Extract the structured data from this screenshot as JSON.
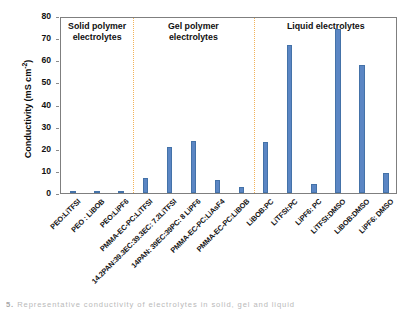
{
  "chart_data": {
    "type": "bar",
    "title": "",
    "xlabel": "",
    "ylabel": "Conductivity (mS cm-2)",
    "ylabel_main": "Conductivity (mS cm",
    "ylabel_exp": "-2",
    "ylabel_close": ")",
    "ylim": [
      0,
      80
    ],
    "yticks": [
      0,
      10,
      20,
      30,
      40,
      50,
      60,
      70,
      80
    ],
    "grid": false,
    "legend": "none",
    "bar_color": "#5b86c4",
    "divider_color": "#f2b35a",
    "axis_color": "#7f7f7f",
    "categories": [
      "PEO:LiTFSI",
      "PEO : LiBOB",
      "PEO:LiPF6",
      "PMMA-EC-PC:LiTFSI",
      "14.2PAN:39.3EC:39.3EC: 7.2LiTFSI",
      "14PAN: 39EC:39PC: 8 LiPF6",
      "PMMA-EC-PC:LiAsF4",
      "PMMA-EC-PC:LiBOB",
      "LiBOB:PC",
      "LiTFSI:PC",
      "LiPF6: PC",
      "LiTFSI:DMSO",
      "LiBOB:DMSO",
      "LiPF6: DMSO"
    ],
    "values": [
      1.0,
      0.8,
      0.3,
      7.0,
      21.0,
      23.5,
      6.0,
      2.5,
      23.0,
      67.0,
      4.0,
      74.0,
      58.0,
      9.0
    ],
    "regions": [
      {
        "label_line1": "Solid polymer",
        "label_line2": "electrolytes",
        "start_index": 0,
        "end_index": 2
      },
      {
        "label_line1": "Gel polymer",
        "label_line2": "electrolytes",
        "start_index": 3,
        "end_index": 7
      },
      {
        "label_line1": "Liquid electrolytes",
        "label_line2": "",
        "start_index": 8,
        "end_index": 13
      }
    ]
  },
  "caption": {
    "number": "5.",
    "text": "Representative conductivity of electrolytes in solid, gel and liquid"
  }
}
